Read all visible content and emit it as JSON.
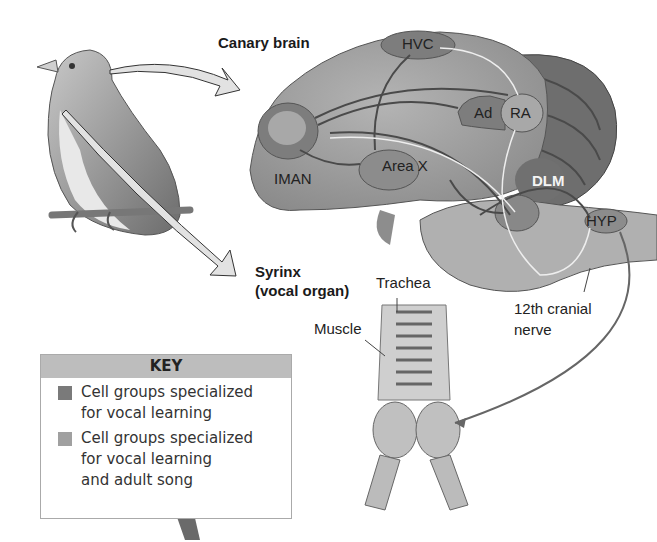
{
  "figure": {
    "labels": {
      "canary_brain": "Canary brain",
      "syrinx_line1": "Syrinx",
      "syrinx_line2": "(vocal organ)",
      "hvc": "HVC",
      "ad": "Ad",
      "ra": "RA",
      "iman": "IMAN",
      "area_x": "Area X",
      "dlm": "DLM",
      "hyp": "HYP",
      "trachea": "Trachea",
      "muscle": "Muscle",
      "nerve_line1": "12th cranial",
      "nerve_line2": "nerve"
    },
    "colors": {
      "brain_fill": "#9a9a9a",
      "nucleus_dark": "#7d7d7d",
      "nucleus_light": "#a8a8a8",
      "cerebellum": "#6e6e6e",
      "arrow_fill": "#e2e2e2"
    }
  },
  "key": {
    "title": "KEY",
    "items": [
      {
        "swatch": "#7a7a7a",
        "line1": "Cell groups specialized",
        "line2": "for vocal learning",
        "line3": ""
      },
      {
        "swatch": "#a0a0a0",
        "line1": "Cell groups specialized",
        "line2": "for vocal learning",
        "line3": "and adult song"
      }
    ]
  }
}
